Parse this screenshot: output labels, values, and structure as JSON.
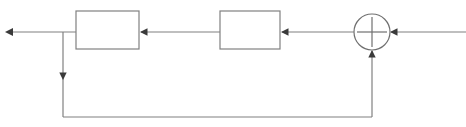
{
  "diagram": {
    "type": "block-diagram",
    "canvas": {
      "width": 466,
      "height": 127,
      "background": "#ffffff"
    },
    "style": {
      "line_color": "#808080",
      "block_stroke": "#808080",
      "block_fill": "#ffffff",
      "arrow_color": "#404040",
      "line_width": 1.2
    },
    "blocks": [
      {
        "id": "block-left",
        "label": "",
        "x": 76,
        "y": 11,
        "width": 63,
        "height": 38
      },
      {
        "id": "block-right",
        "label": "",
        "x": 220,
        "y": 11,
        "width": 60,
        "height": 38
      }
    ],
    "summing_junction": {
      "id": "summing-junction",
      "label": "",
      "cx": 372,
      "cy": 32,
      "r": 18,
      "cross": true,
      "sign_left": "",
      "sign_bottom": ""
    },
    "signals": [
      {
        "id": "input-signal",
        "label": "",
        "from": "right-edge",
        "to": "summing-junction",
        "direction": "leftward"
      },
      {
        "id": "forward-signal-1",
        "label": "",
        "from": "summing-junction",
        "to": "block-right",
        "direction": "leftward"
      },
      {
        "id": "forward-signal-2",
        "label": "",
        "from": "block-right",
        "to": "block-left",
        "direction": "leftward"
      },
      {
        "id": "output-signal",
        "label": "",
        "from": "block-left",
        "to": "left-edge",
        "direction": "leftward"
      },
      {
        "id": "feedback-signal",
        "label": "",
        "from": "output-branch",
        "to": "summing-junction",
        "direction": "downward-then-right-then-up"
      }
    ],
    "branch_point": {
      "id": "feedback-branch-point",
      "x": 63,
      "y": 32
    }
  }
}
